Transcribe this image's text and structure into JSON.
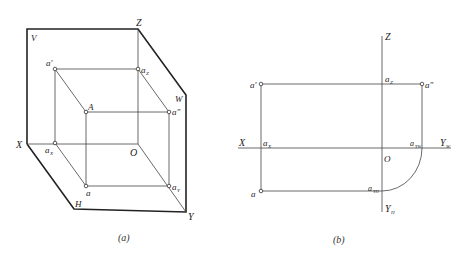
{
  "figure_a": {
    "caption": "(a)",
    "planes": {
      "V": "V",
      "H": "H",
      "W": "W"
    },
    "axes": {
      "X": "X",
      "Y": "Y",
      "Z": "Z",
      "O": "O"
    },
    "points": {
      "A": "A",
      "a": "a",
      "a_prime": "a'",
      "a_double_prime": "a\"",
      "aX": "a",
      "aX_sub": "X",
      "aY": "a",
      "aY_sub": "Y",
      "aZ": "a",
      "aZ_sub": "Z"
    }
  },
  "figure_b": {
    "caption": "(b)",
    "axes": {
      "X": "X",
      "Z": "Z",
      "O": "O",
      "YW": "Y",
      "YW_sub": "W",
      "YH": "Y",
      "YH_sub": "H"
    },
    "points": {
      "a": "a",
      "a_prime": "a'",
      "a_double_prime": "a\"",
      "aX": "a",
      "aX_sub": "X",
      "aZ": "a",
      "aZ_sub": "Z",
      "aYW": "a",
      "aYW_sub": "YW",
      "aYH": "a",
      "aYH_sub": "YH"
    }
  }
}
